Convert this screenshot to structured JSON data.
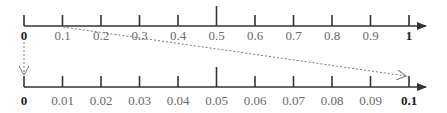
{
  "diagram": {
    "top_axis": {
      "range": [
        0,
        1
      ],
      "step": 0.1,
      "labels": [
        "0",
        "0.1",
        "0.2",
        "0.3",
        "0.4",
        "0.5",
        "0.6",
        "0.7",
        "0.8",
        "0.9",
        "1"
      ],
      "bold_labels": [
        "0",
        "1"
      ],
      "tall_tick_index": 5
    },
    "bottom_axis": {
      "range": [
        0,
        0.1
      ],
      "step": 0.01,
      "labels": [
        "0",
        "0.01",
        "0.02",
        "0.03",
        "0.04",
        "0.05",
        "0.06",
        "0.07",
        "0.08",
        "0.09",
        "0.1"
      ],
      "bold_labels": [
        "0",
        "0.1"
      ],
      "tall_tick_index": 5
    },
    "connectors": [
      {
        "name": "zero-connector",
        "from": "top 0",
        "to": "bottom 0",
        "style": "dotted-arrow"
      },
      {
        "name": "tenth-connector",
        "from": "top 0.1",
        "to": "bottom 0.1",
        "style": "dotted-arrow"
      }
    ],
    "colors": {
      "axis": "#333333",
      "connector": "#7a7a7a",
      "label": "#6a6a6a",
      "label_bold": "#1a1a1a"
    }
  }
}
